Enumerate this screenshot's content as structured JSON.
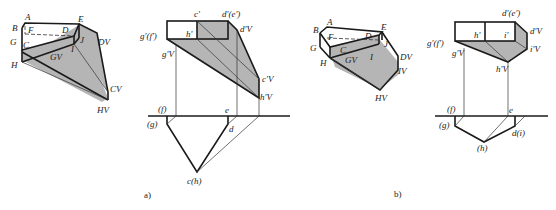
{
  "figure": {
    "panels": [
      {
        "caption": "a)",
        "axonometric": {
          "labels": [
            "A",
            "B",
            "F",
            "G",
            "C",
            "D",
            "E",
            "I",
            "J",
            "H",
            "GV",
            "DV",
            "CV",
            "HV"
          ]
        },
        "orthographic": {
          "front_view_labels": [
            "c'",
            "d'(e')",
            "g'(f')",
            "h'",
            "d'V",
            "g'V",
            "c'V",
            "h'V"
          ],
          "top_view_labels": [
            "(f)",
            "e",
            "(g)",
            "d",
            "c(h)"
          ]
        }
      },
      {
        "caption": "b)",
        "axonometric": {
          "labels": [
            "A",
            "B",
            "F",
            "G",
            "C",
            "D",
            "E",
            "J",
            "I",
            "H",
            "GV",
            "DV",
            "IV",
            "HV"
          ]
        },
        "orthographic": {
          "front_view_labels": [
            "d'(e')",
            "g'(f')",
            "h'",
            "i'",
            "d'V",
            "i'V",
            "g'V",
            "h'V"
          ],
          "top_view_labels": [
            "(f)",
            "e",
            "(g)",
            "d(i)",
            "(h)"
          ]
        }
      }
    ]
  },
  "labels": {
    "a": {
      "A": "A",
      "B": "B",
      "F": "F",
      "G": "G",
      "C": "C",
      "D": "D",
      "E": "E",
      "I": "I",
      "J": "J",
      "H": "H",
      "GV": "GV",
      "DV": "DV",
      "CV": "CV",
      "HV": "HV",
      "c1": "c'",
      "de1": "d'(e')",
      "gf1": "g'(f')",
      "h1": "h'",
      "dv1": "d'V",
      "gv1": "g'V",
      "cv1": "c'V",
      "hv1": "h'V",
      "f": "(f)",
      "e": "e",
      "g": "(g)",
      "d": "d",
      "ch": "c(h)",
      "caption": "a)"
    },
    "b": {
      "A": "A",
      "B": "B",
      "F": "F",
      "G": "G",
      "C": "C",
      "D": "D",
      "E": "E",
      "J": "J",
      "I": "I",
      "H": "H",
      "GV": "GV",
      "DV": "DV",
      "IV": "IV",
      "HV": "HV",
      "de1": "d'(e')",
      "gf1": "g'(f')",
      "h1": "h'",
      "i1": "i'",
      "dv1": "d'V",
      "iv1": "i'V",
      "gv1": "g'V",
      "hv1": "h'V",
      "f": "(f)",
      "e": "e",
      "g": "(g)",
      "di": "d(i)",
      "h": "(h)",
      "caption": "b)"
    }
  }
}
